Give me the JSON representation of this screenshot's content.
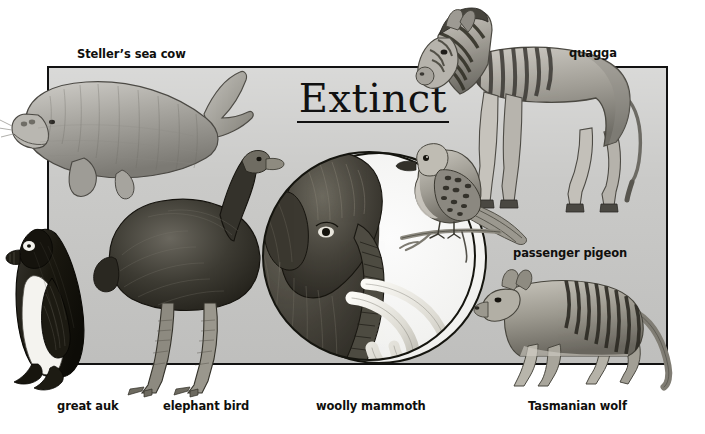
{
  "poster": {
    "title": "Extinct",
    "background_color": "#ffffff",
    "panel_color": "#c9c9c7",
    "panel_border_color": "#121212",
    "ink_color": "#100f0d",
    "ellipse_fill": "#f7f7f5"
  },
  "labels": [
    {
      "id": "stellers-sea-cow",
      "text": "Steller’s sea cow"
    },
    {
      "id": "quagga",
      "text": "quagga"
    },
    {
      "id": "passenger-pigeon",
      "text": "passenger pigeon"
    },
    {
      "id": "great-auk",
      "text": "great auk"
    },
    {
      "id": "elephant-bird",
      "text": "elephant bird"
    },
    {
      "id": "woolly-mammoth",
      "text": "woolly mammoth"
    },
    {
      "id": "tasmanian-wolf",
      "text": "Tasmanian wolf"
    }
  ],
  "illustrations": [
    {
      "id": "stellers-sea-cow",
      "name": "stellers-sea-cow-illustration"
    },
    {
      "id": "quagga",
      "name": "quagga-illustration"
    },
    {
      "id": "passenger-pigeon",
      "name": "passenger-pigeon-illustration"
    },
    {
      "id": "great-auk",
      "name": "great-auk-illustration"
    },
    {
      "id": "elephant-bird",
      "name": "elephant-bird-illustration"
    },
    {
      "id": "woolly-mammoth",
      "name": "woolly-mammoth-illustration"
    },
    {
      "id": "tasmanian-wolf",
      "name": "tasmanian-wolf-illustration"
    }
  ]
}
